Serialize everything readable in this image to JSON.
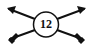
{
  "diagram": {
    "center_label": "12",
    "stroke_color": "#111111",
    "background": "#ffffff",
    "elements": [
      {
        "name": "circle-node",
        "label": "12"
      },
      {
        "name": "arrow-upper-left",
        "direction": "up-left",
        "end": "arrowhead"
      },
      {
        "name": "arrow-lower-left",
        "direction": "down-left",
        "end": "fletching"
      },
      {
        "name": "arrow-upper-right",
        "direction": "up-right",
        "end": "arrowhead"
      },
      {
        "name": "arrow-lower-right",
        "direction": "down-right",
        "end": "fletching"
      }
    ]
  }
}
